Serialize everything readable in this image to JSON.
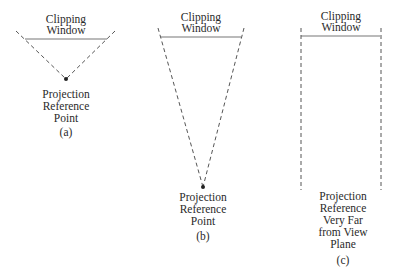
{
  "panels": [
    {
      "id": "a",
      "window_label": [
        "Clipping",
        "Window"
      ],
      "point_label": [
        "Projection",
        "Reference",
        "Point"
      ],
      "caption": "(a)"
    },
    {
      "id": "b",
      "window_label": [
        "Clipping",
        "Window"
      ],
      "point_label": [
        "Projection",
        "Reference",
        "Point"
      ],
      "caption": "(b)"
    },
    {
      "id": "c",
      "window_label": [
        "Clipping",
        "Window"
      ],
      "point_label": [
        "Projection",
        "Reference",
        "Very Far",
        "from View",
        "Plane"
      ],
      "caption": "(c)"
    }
  ]
}
